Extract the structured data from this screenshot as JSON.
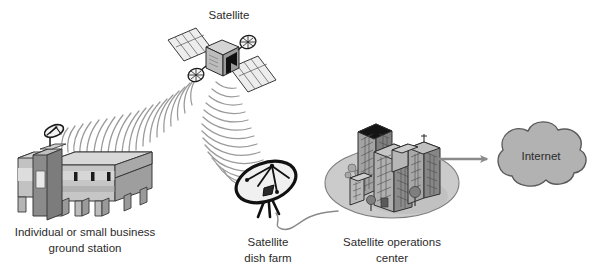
{
  "diagram": {
    "background_color": "#ffffff",
    "labels": {
      "satellite": "Satellite",
      "ground_station_line1": "Individual or small business",
      "ground_station_line2": "ground station",
      "dish_farm_line1": "Satellite",
      "dish_farm_line2": "dish farm",
      "operations_center_line1": "Satellite operations",
      "operations_center_line2": "center",
      "internet": "Internet"
    },
    "colors": {
      "outline": "#1a1a1a",
      "text": "#2b2b2b",
      "wave": "#9a9a9a",
      "cloud_fill": "#b2b2b2",
      "cloud_stroke": "#5a5a5a",
      "arrow": "#8a8a8a",
      "building_light": "#d2d2d2",
      "building_mid": "#b4b4b4",
      "building_dark": "#8e8e8e",
      "building_roof_dark": "#1c1c1c",
      "ground_ellipse": "#c9c9c9",
      "panel_fill": "#ececec",
      "cable": "#8a8a8a"
    },
    "nodes": [
      {
        "id": "satellite",
        "name": "satellite",
        "label": "Satellite",
        "x": 218,
        "y": 55,
        "description": "Orbiting satellite with two solar panel wings and two dish antennas"
      },
      {
        "id": "ground-station",
        "name": "individual-or-small-business-ground-station",
        "label": "Individual or small business ground station",
        "x": 85,
        "y": 180,
        "description": "Low-rise building with rooftop dish antenna"
      },
      {
        "id": "dish-farm",
        "name": "satellite-dish-farm",
        "label": "Satellite dish farm",
        "x": 268,
        "y": 190,
        "description": "Large parabolic dish on tripod mount"
      },
      {
        "id": "operations-center",
        "name": "satellite-operations-center",
        "label": "Satellite operations center",
        "x": 385,
        "y": 170,
        "description": "Cluster of office towers on an elliptical ground plot"
      },
      {
        "id": "internet",
        "name": "internet-cloud",
        "label": "Internet",
        "x": 527,
        "y": 160,
        "description": "Cloud symbol representing the Internet"
      }
    ],
    "links": [
      {
        "id": "uplink-ground-satellite",
        "name": "radio-link-ground-station-to-satellite",
        "from": "ground-station",
        "to": "satellite",
        "type": "radio-waves",
        "style": "concentric-arcs"
      },
      {
        "id": "downlink-satellite-dishfarm",
        "name": "radio-link-satellite-to-dish-farm",
        "from": "satellite",
        "to": "dish-farm",
        "type": "radio-waves",
        "style": "concentric-arcs"
      },
      {
        "id": "cable-dishfarm-ops",
        "name": "cable-dish-farm-to-operations-center",
        "from": "dish-farm",
        "to": "operations-center",
        "type": "cable",
        "style": "wavy-line"
      },
      {
        "id": "link-ops-internet",
        "name": "connection-operations-center-to-internet",
        "from": "operations-center",
        "to": "internet",
        "type": "arrow",
        "style": "straight-arrow"
      }
    ]
  }
}
